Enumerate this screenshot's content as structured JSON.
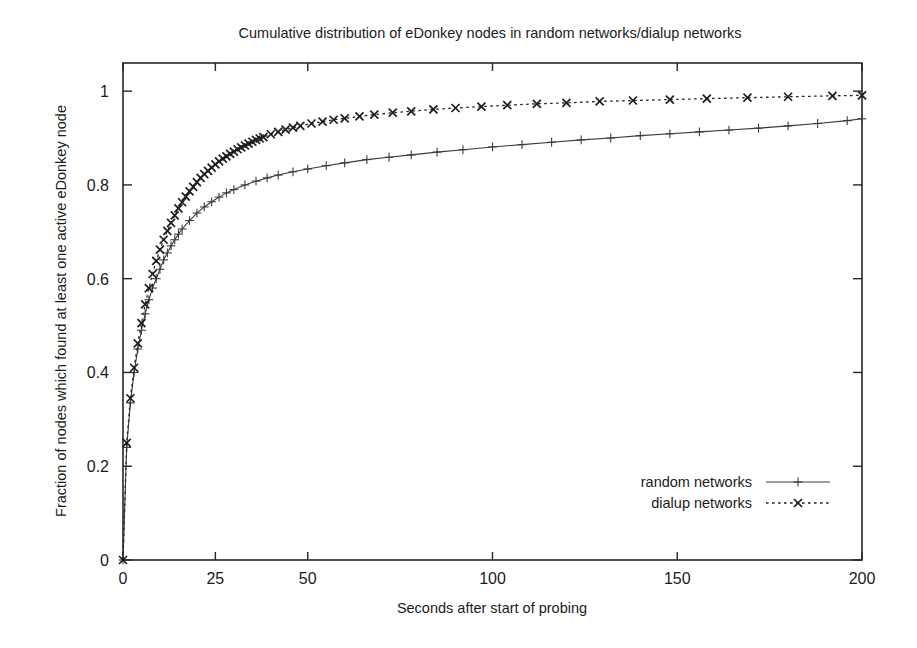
{
  "figure": {
    "title": "Cumulative distribution of eDonkey nodes in random networks/dialup networks"
  },
  "axes": {
    "x_title": "Seconds after start of probing",
    "y_title": "Fraction of nodes which found at least one active eDonkey node"
  },
  "legend": {
    "position": "bottom-right",
    "entries": [
      {
        "label": "random networks",
        "marker": "plus-marker",
        "line": "solid"
      },
      {
        "label": "dialup networks",
        "marker": "cross-marker",
        "line": "dotted"
      }
    ]
  },
  "colors": {
    "random_networks": "#3a3a3a",
    "dialup_networks": "#1d1d1d",
    "frame": "#262626",
    "background": "#ffffff"
  },
  "chart_data": {
    "type": "line",
    "title": "Cumulative distribution of eDonkey nodes in random networks/dialup networks",
    "xlabel": "Seconds after start of probing",
    "ylabel": "Fraction of nodes which found at least one active eDonkey node",
    "xlim": [
      0,
      200
    ],
    "ylim": [
      0,
      1.06
    ],
    "xticks": [
      0,
      25,
      50,
      100,
      150,
      200
    ],
    "xtick_labels": [
      "0",
      "25",
      "50",
      "100",
      "150",
      "200"
    ],
    "yticks": [
      0,
      0.2,
      0.4,
      0.6,
      0.8,
      1
    ],
    "ytick_labels": [
      "0",
      "0.2",
      "0.4",
      "0.6",
      "0.8",
      "1"
    ],
    "grid": false,
    "legend_position": "bottom-right",
    "series": [
      {
        "name": "random networks",
        "marker": "+",
        "linestyle": "solid",
        "color": "#3a3a3a",
        "x": [
          0,
          1,
          2,
          3,
          4,
          5,
          6,
          7,
          8,
          9,
          10,
          11,
          12,
          13,
          14,
          15,
          16,
          18,
          20,
          22,
          24,
          26,
          28,
          30,
          33,
          36,
          39,
          42,
          46,
          50,
          55,
          60,
          66,
          72,
          78,
          85,
          92,
          100,
          108,
          116,
          124,
          132,
          140,
          148,
          156,
          164,
          172,
          180,
          188,
          196,
          200
        ],
        "y": [
          0.0,
          0.24,
          0.335,
          0.4,
          0.45,
          0.49,
          0.525,
          0.555,
          0.58,
          0.6,
          0.62,
          0.64,
          0.655,
          0.67,
          0.683,
          0.695,
          0.706,
          0.724,
          0.74,
          0.753,
          0.764,
          0.774,
          0.783,
          0.79,
          0.8,
          0.808,
          0.815,
          0.821,
          0.828,
          0.834,
          0.841,
          0.847,
          0.854,
          0.859,
          0.864,
          0.87,
          0.875,
          0.881,
          0.886,
          0.891,
          0.896,
          0.9,
          0.905,
          0.909,
          0.913,
          0.917,
          0.921,
          0.926,
          0.931,
          0.937,
          0.941
        ]
      },
      {
        "name": "dialup networks",
        "marker": "x",
        "linestyle": "dotted",
        "color": "#1d1d1d",
        "x": [
          0,
          1,
          2,
          3,
          4,
          5,
          6,
          7,
          8,
          9,
          10,
          11,
          12,
          13,
          14,
          15,
          16,
          17,
          18,
          19,
          20,
          21,
          22,
          23,
          24,
          25,
          26,
          27,
          28,
          29,
          30,
          31,
          32,
          33,
          34,
          35,
          36,
          37,
          38,
          40,
          42,
          44,
          46,
          48,
          51,
          54,
          57,
          60,
          64,
          68,
          73,
          78,
          84,
          90,
          97,
          104,
          112,
          120,
          129,
          138,
          148,
          158,
          169,
          180,
          192,
          200
        ],
        "y": [
          0.0,
          0.25,
          0.345,
          0.41,
          0.462,
          0.505,
          0.545,
          0.58,
          0.61,
          0.638,
          0.662,
          0.683,
          0.702,
          0.719,
          0.735,
          0.75,
          0.763,
          0.775,
          0.786,
          0.796,
          0.806,
          0.815,
          0.823,
          0.83,
          0.837,
          0.844,
          0.85,
          0.856,
          0.861,
          0.866,
          0.871,
          0.876,
          0.88,
          0.884,
          0.888,
          0.892,
          0.896,
          0.899,
          0.902,
          0.908,
          0.913,
          0.918,
          0.922,
          0.926,
          0.931,
          0.935,
          0.939,
          0.942,
          0.946,
          0.95,
          0.954,
          0.957,
          0.961,
          0.964,
          0.967,
          0.97,
          0.973,
          0.975,
          0.978,
          0.98,
          0.982,
          0.984,
          0.986,
          0.988,
          0.99,
          0.991
        ]
      }
    ]
  }
}
